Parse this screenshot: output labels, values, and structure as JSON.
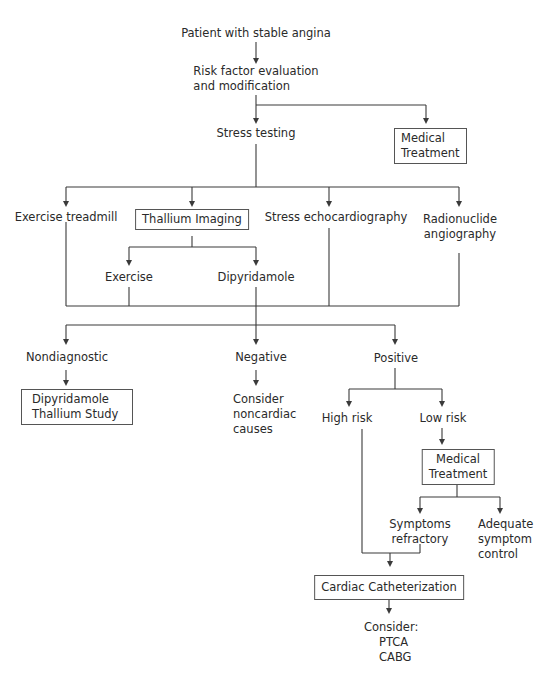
{
  "diagram": {
    "type": "flowchart",
    "nodes": {
      "start": "Patient with stable angina",
      "risk_line1": "Risk factor evaluation",
      "risk_line2": "and modification",
      "stress_testing": "Stress testing",
      "medical_treatment_top_line1": "Medical",
      "medical_treatment_top_line2": "Treatment",
      "exercise_treadmill": "Exercise treadmill",
      "thallium_imaging": "Thallium Imaging",
      "stress_echo": "Stress echocardiography",
      "radionuclide_line1": "Radionuclide",
      "radionuclide_line2": "angiography",
      "exercise": "Exercise",
      "dipyridamole": "Dipyridamole",
      "nondiagnostic": "Nondiagnostic",
      "negative": "Negative",
      "positive": "Positive",
      "dipy_thallium_line1": "Dipyridamole",
      "dipy_thallium_line2": "Thallium Study",
      "noncardiac_line1": "Consider",
      "noncardiac_line2": "noncardiac",
      "noncardiac_line3": "causes",
      "high_risk": "High risk",
      "low_risk": "Low risk",
      "medical_treatment_low_line1": "Medical",
      "medical_treatment_low_line2": "Treatment",
      "symptoms_line1": "Symptoms",
      "symptoms_line2": "refractory",
      "adequate_line1": "Adequate",
      "adequate_line2": "symptom",
      "adequate_line3": "control",
      "cardiac_cath": "Cardiac Catheterization",
      "consider_line1": "Consider:",
      "consider_line2": "PTCA",
      "consider_line3": "CABG"
    },
    "edges": [
      [
        "Patient with stable angina",
        "Risk factor evaluation and modification"
      ],
      [
        "Risk factor evaluation and modification",
        "Stress testing"
      ],
      [
        "Risk factor evaluation and modification",
        "Medical Treatment"
      ],
      [
        "Stress testing",
        "Exercise treadmill"
      ],
      [
        "Stress testing",
        "Thallium Imaging"
      ],
      [
        "Stress testing",
        "Stress echocardiography"
      ],
      [
        "Stress testing",
        "Radionuclide angiography"
      ],
      [
        "Thallium Imaging",
        "Exercise"
      ],
      [
        "Thallium Imaging",
        "Dipyridamole"
      ],
      [
        "All tests",
        "Nondiagnostic"
      ],
      [
        "All tests",
        "Negative"
      ],
      [
        "All tests",
        "Positive"
      ],
      [
        "Nondiagnostic",
        "Dipyridamole Thallium Study"
      ],
      [
        "Negative",
        "Consider noncardiac causes"
      ],
      [
        "Positive",
        "High risk"
      ],
      [
        "Positive",
        "Low risk"
      ],
      [
        "Low risk",
        "Medical Treatment"
      ],
      [
        "Medical Treatment",
        "Symptoms refractory"
      ],
      [
        "Medical Treatment",
        "Adequate symptom control"
      ],
      [
        "High risk",
        "Cardiac Catheterization"
      ],
      [
        "Symptoms refractory",
        "Cardiac Catheterization"
      ],
      [
        "Cardiac Catheterization",
        "Consider: PTCA CABG"
      ]
    ]
  }
}
